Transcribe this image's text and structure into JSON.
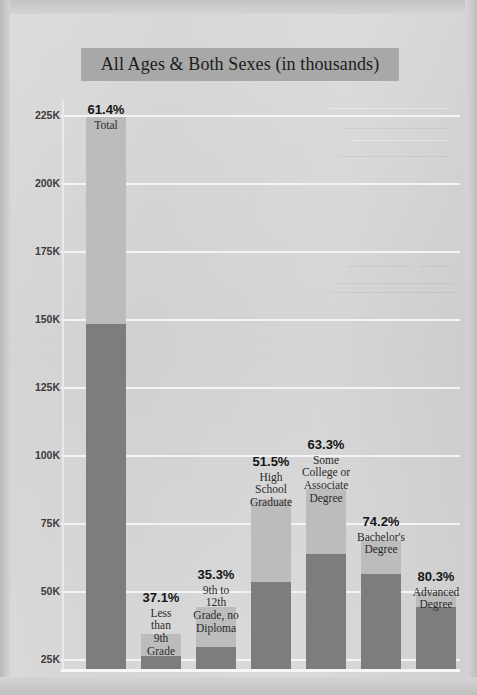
{
  "chart_data": {
    "type": "bar",
    "title": "All Ages & Both Sexes (in thousands)",
    "xlabel": "",
    "ylabel": "",
    "ylim": [
      0,
      212
    ],
    "grid": true,
    "legend": "none",
    "unit": "thousands",
    "yticks": [
      "225K",
      "200K",
      "175K",
      "150K",
      "125K",
      "100K",
      "75K",
      "50K",
      "25K"
    ],
    "ytick_values": [
      225,
      200,
      175,
      150,
      125,
      100,
      75,
      50,
      25
    ],
    "categories": [
      "Total",
      "Less than 9th Grade",
      "9th to 12th Grade, no Diploma",
      "High School Graduate",
      "Some College or Associate Degree",
      "Bachelor's Degree",
      "Advanced Degree"
    ],
    "data_labels": [
      "61.4%",
      "37.1%",
      "35.3%",
      "51.5%",
      "63.3%",
      "74.2%",
      "80.3%"
    ],
    "series": [
      {
        "name": "Reported",
        "values": [
          127,
          5,
          8,
          32,
          42,
          35,
          22
        ]
      },
      {
        "name": "Total population",
        "values": [
          203,
          13,
          23,
          62,
          66,
          47,
          28
        ]
      }
    ],
    "annotations": []
  },
  "bars": [
    {
      "label_pct": "61.4%",
      "name_lines": [
        "Total"
      ],
      "total_px": 552,
      "dark_px": 345,
      "x": 68,
      "w": 40,
      "label_top": 85
    },
    {
      "label_pct": "37.1%",
      "name_lines": [
        "Less",
        "than",
        "9th",
        "Grade"
      ],
      "total_px": 35,
      "dark_px": 13,
      "x": 123,
      "w": 40,
      "label_top": 573
    },
    {
      "label_pct": "35.3%",
      "name_lines": [
        "9th to",
        "12th",
        "Grade, no",
        "Diploma"
      ],
      "total_px": 62,
      "dark_px": 22,
      "x": 178,
      "w": 40,
      "label_top": 550
    },
    {
      "label_pct": "51.5%",
      "name_lines": [
        "High",
        "School",
        "Graduate"
      ],
      "total_px": 170,
      "dark_px": 87,
      "x": 233,
      "w": 40,
      "label_top": 437
    },
    {
      "label_pct": "63.3%",
      "name_lines": [
        "Some",
        "College or",
        "Associate",
        "Degree"
      ],
      "total_px": 180,
      "dark_px": 115,
      "x": 288,
      "w": 40,
      "label_top": 420
    },
    {
      "label_pct": "74.2%",
      "name_lines": [
        "Bachelor's",
        "Degree"
      ],
      "total_px": 128,
      "dark_px": 95,
      "x": 343,
      "w": 40,
      "label_top": 497
    },
    {
      "label_pct": "80.3%",
      "name_lines": [
        "Advanced",
        "Degree"
      ],
      "total_px": 77,
      "dark_px": 62,
      "x": 398,
      "w": 40,
      "label_top": 552
    }
  ],
  "gridlines_px": [
    97,
    165,
    233,
    301,
    369,
    437,
    505,
    573,
    641
  ],
  "colors": {
    "bar_light": "#bcbcbc",
    "bar_dark": "#7d7d7d",
    "gridline": "#f4f4f4",
    "title_band": "#a8a8a8",
    "paper": "#d4d4d4",
    "text": "#1c1c1c"
  }
}
